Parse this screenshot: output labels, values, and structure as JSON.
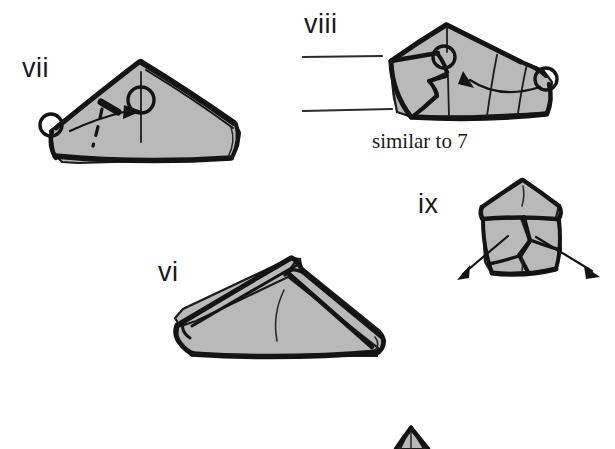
{
  "page": {
    "width": 615,
    "height": 449,
    "background_color": "#ffffff",
    "paper_fill_color": "#b9b9b9",
    "ink_color": "#141414",
    "style": "hand-drawn line art, grey shaded paper faces"
  },
  "labels": {
    "step_vi": "vi",
    "step_vii": "vii",
    "step_viii": "viii",
    "step_ix": "ix"
  },
  "captions": {
    "similar_to_7": "similar to 7"
  },
  "steps": [
    {
      "id": "vii",
      "label": "vii",
      "label_position": {
        "x": 22,
        "y": 77
      },
      "description": "Wide low triangular folded packet seen edge-on with an apex near the left of centre; a hinge circle sits at the far left point, a curved arrow sweeps right from it, a dashed valley-fold line runs down from the upper edge, and a circled vertical axis marks a pivot at the apex.",
      "annotations": [
        "hinge-circle-left",
        "curved-arrow-right",
        "dashed-fold-line",
        "pivot-circle-axis"
      ]
    },
    {
      "id": "viii",
      "label": "viii",
      "label_position": {
        "x": 304,
        "y": 33
      },
      "description": "Same packet rotated, now showing a pointed peak at the top and a squashed flap at the lower left; hinge circles at the upper-left and right corners with a long curved arrow running leftwards between them across the face.",
      "annotations": [
        "hinge-circle-upper-left",
        "hinge-circle-right",
        "curved-arrow-left",
        "interior-fold-lines"
      ],
      "rules": [
        {
          "x1": 303,
          "y1": 57,
          "x2": 382,
          "y2": 56
        },
        {
          "x1": 303,
          "y1": 111,
          "x2": 392,
          "y2": 109
        }
      ],
      "caption": "similar to 7",
      "caption_position": {
        "x": 372,
        "y": 148
      }
    },
    {
      "id": "ix",
      "label": "ix",
      "label_position": {
        "x": 418,
        "y": 213
      },
      "description": "Compact pentagonal form viewed head-on with an upper triangular roof and two overlapping lower flaps; a pair of straight arrows diverge outward and downward to the lower left and lower right.",
      "annotations": [
        "diverging-arrow-left",
        "diverging-arrow-right",
        "center-crease"
      ]
    },
    {
      "id": "vi",
      "label": "vi",
      "label_position": {
        "x": 158,
        "y": 281
      },
      "description": "Long low wedge-shaped packet with a raised ridge along the top-left edge meeting a peak at upper centre-right, a small hinge gap below the peak, and a single curved crease drawn on the front face.",
      "annotations": [
        "hinge-notch",
        "curved-crease"
      ]
    },
    {
      "id": "next-partial",
      "label": "",
      "label_position": {
        "x": 0,
        "y": 0
      },
      "description": "Top apex only of the following diagram, cropped by the bottom edge of the page.",
      "annotations": [
        "cropped-apex"
      ]
    }
  ]
}
